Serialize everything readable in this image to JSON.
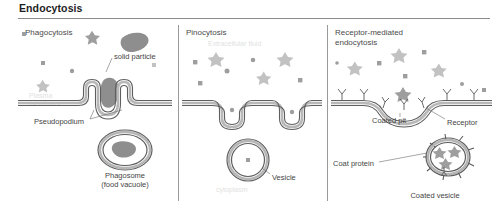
{
  "figure": {
    "title": "Endocytosis",
    "panels": [
      {
        "id": "phagocytosis",
        "title": "Phagocytosis",
        "labels": {
          "solid_particle": "solid particle",
          "pseudopodium": "Pseudopodium",
          "phagosome": "Phagosome\n(food vacuole)",
          "plasma_membrane": "Plasma\nmembrane"
        }
      },
      {
        "id": "pinocytosis",
        "title": "Pinocytosis",
        "labels": {
          "extracellular_fluid": "Extracellular fluid",
          "vesicle": "Vesicle",
          "cytoplasm": "cytoplasm"
        }
      },
      {
        "id": "receptor-mediated-endocytosis",
        "title": "Receptor-mediated\nendocytosis",
        "labels": {
          "coated_pit": "Coated pit",
          "receptor": "Receptor",
          "coat_protein": "Coat protein",
          "coated_vesicle": "Coated vesicle"
        }
      }
    ],
    "colors": {
      "title_text": "#1d1d1d",
      "label_text": "#454545",
      "faint_text": "#e2e2e2",
      "membrane_outline": "#5f5f5f",
      "membrane_fill": "#b8b8b8",
      "particle": "#8e8e8e",
      "divider": "#9a9a9a",
      "rule": "#8b8b8b",
      "background": "#ffffff"
    }
  }
}
